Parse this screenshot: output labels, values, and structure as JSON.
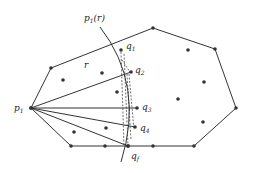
{
  "labels": {
    "p1_r": "p",
    "p1_r_sub": "1",
    "p1_r_arg": "(r)",
    "r": "r",
    "p1": "p",
    "p1_sub": "1",
    "q1": "q",
    "q1_sub": "1",
    "q2": "q",
    "q2_sub": "2",
    "q3": "q",
    "q3_sub": "3",
    "q4": "q",
    "q4_sub": "4",
    "qf": "q",
    "qf_sub": "f"
  },
  "colors": {
    "stroke": "#333333",
    "point": "#333333"
  }
}
